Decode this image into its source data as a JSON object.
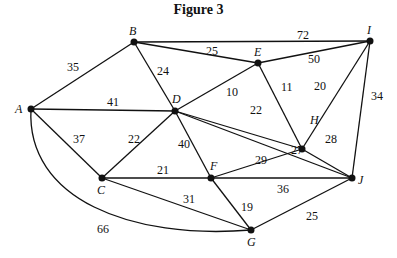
{
  "title": "Figure 3",
  "graph": {
    "nodes": [
      {
        "id": "A",
        "x": 31,
        "y": 109,
        "lx": 15,
        "ly": 113
      },
      {
        "id": "B",
        "x": 134,
        "y": 42,
        "lx": 129,
        "ly": 35
      },
      {
        "id": "D",
        "x": 175,
        "y": 111,
        "lx": 172,
        "ly": 103
      },
      {
        "id": "E",
        "x": 258,
        "y": 63,
        "lx": 254,
        "ly": 56
      },
      {
        "id": "I",
        "x": 370,
        "y": 41,
        "lx": 367,
        "ly": 34
      },
      {
        "id": "H",
        "x": 302,
        "y": 149,
        "lx": 310,
        "ly": 124
      },
      {
        "id": "C",
        "x": 102,
        "y": 178,
        "lx": 97,
        "ly": 194
      },
      {
        "id": "F",
        "x": 211,
        "y": 178,
        "lx": 210,
        "ly": 170
      },
      {
        "id": "J",
        "x": 352,
        "y": 178,
        "lx": 358,
        "ly": 184
      },
      {
        "id": "G",
        "x": 251,
        "y": 230,
        "lx": 247,
        "ly": 246
      }
    ],
    "edges": [
      {
        "from": "A",
        "to": "B",
        "weight": "35",
        "lx": 67,
        "ly": 71
      },
      {
        "from": "A",
        "to": "D",
        "weight": "41",
        "lx": 107,
        "ly": 106
      },
      {
        "from": "A",
        "to": "C",
        "weight": "37",
        "lx": 73,
        "ly": 143
      },
      {
        "from": "A",
        "to": "G",
        "weight": "66",
        "lx": 97,
        "ly": 233,
        "curve": true
      },
      {
        "from": "B",
        "to": "D",
        "weight": "24",
        "lx": 157,
        "ly": 75
      },
      {
        "from": "B",
        "to": "E",
        "weight": "25",
        "lx": 206,
        "ly": 55
      },
      {
        "from": "B",
        "to": "I",
        "weight": "72",
        "lx": 297,
        "ly": 39
      },
      {
        "from": "E",
        "to": "I",
        "weight": "50",
        "lx": 308,
        "ly": 63
      },
      {
        "from": "D",
        "to": "E",
        "weight": "10",
        "lx": 226,
        "ly": 96
      },
      {
        "from": "E",
        "to": "H",
        "weight": "11",
        "lx": 281,
        "ly": 91
      },
      {
        "from": "I",
        "to": "H",
        "weight": "20",
        "lx": 314,
        "ly": 90
      },
      {
        "from": "I",
        "to": "J",
        "weight": "34",
        "lx": 371,
        "ly": 100
      },
      {
        "from": "D",
        "to": "H",
        "weight": "22",
        "lx": 250,
        "ly": 114
      },
      {
        "from": "D",
        "to": "C",
        "weight": "22",
        "lx": 128,
        "ly": 143
      },
      {
        "from": "D",
        "to": "F",
        "weight": "40",
        "lx": 178,
        "ly": 148
      },
      {
        "from": "D",
        "to": "J",
        "weight": "27",
        "lx": 291,
        "ly": 154
      },
      {
        "from": "H",
        "to": "J",
        "weight": "28",
        "lx": 325,
        "ly": 143
      },
      {
        "from": "F",
        "to": "H",
        "weight": "29",
        "lx": 255,
        "ly": 164
      },
      {
        "from": "C",
        "to": "F",
        "weight": "21",
        "lx": 157,
        "ly": 174
      },
      {
        "from": "C",
        "to": "G",
        "weight": "31",
        "lx": 183,
        "ly": 203
      },
      {
        "from": "F",
        "to": "J",
        "weight": "36",
        "lx": 277,
        "ly": 193
      },
      {
        "from": "F",
        "to": "G",
        "weight": "19",
        "lx": 241,
        "ly": 211
      },
      {
        "from": "G",
        "to": "J",
        "weight": "25",
        "lx": 306,
        "ly": 220
      }
    ]
  }
}
